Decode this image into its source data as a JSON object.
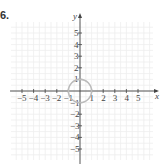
{
  "problem_label": "6.",
  "chart_data": {
    "type": "scatter",
    "title": "",
    "xlabel": "x",
    "ylabel": "y",
    "xlim": [
      -5,
      5
    ],
    "ylim": [
      -5,
      5
    ],
    "grid": true,
    "x_ticks": [
      -5,
      -4,
      -3,
      -2,
      -1,
      1,
      2,
      3,
      4,
      5
    ],
    "y_ticks": [
      5,
      4,
      3,
      2,
      1,
      -1,
      -2,
      -3,
      -4,
      -5
    ],
    "x_tick_labels": [
      "−5",
      "−4",
      "−3",
      "−2",
      "−1",
      "1",
      "2",
      "3",
      "4",
      "5"
    ],
    "y_tick_labels": [
      "5",
      "4",
      "3",
      "2",
      "1",
      "−1",
      "−2",
      "−3",
      "−4",
      "−5"
    ],
    "shapes": [
      {
        "type": "circle",
        "center": [
          0,
          0
        ],
        "radius": 1,
        "color": "#bbbbbb"
      }
    ],
    "colors": {
      "grid": "#eeeeee",
      "axis": "#444444",
      "curve": "#bbbbbb"
    }
  }
}
